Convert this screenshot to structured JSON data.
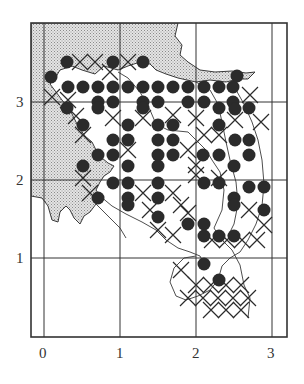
{
  "figure": {
    "type": "distribution-grid-map",
    "x_axis": {
      "ticks": [
        "0",
        "1",
        "2",
        "3"
      ]
    },
    "y_axis": {
      "ticks": [
        "1",
        "2",
        "3"
      ]
    },
    "legend_symbols": {
      "dot": "filled-circle-record",
      "cross": "x-mark-record"
    },
    "colors": {
      "land_shading": "#cfcfcf",
      "ink": "#2b2b2b",
      "background": "#ffffff"
    }
  },
  "dots": [
    [
      51,
      77
    ],
    [
      67,
      62
    ],
    [
      113,
      62
    ],
    [
      143,
      62
    ],
    [
      68,
      87
    ],
    [
      83,
      87
    ],
    [
      98,
      87
    ],
    [
      113,
      87
    ],
    [
      128,
      87
    ],
    [
      143,
      87
    ],
    [
      158,
      87
    ],
    [
      173,
      87
    ],
    [
      188,
      87
    ],
    [
      204,
      87
    ],
    [
      219,
      87
    ],
    [
      233,
      87
    ],
    [
      237,
      76
    ],
    [
      98,
      102
    ],
    [
      113,
      102
    ],
    [
      143,
      102
    ],
    [
      158,
      102
    ],
    [
      188,
      102
    ],
    [
      204,
      102
    ],
    [
      233,
      102
    ],
    [
      67,
      108
    ],
    [
      98,
      108
    ],
    [
      143,
      108
    ],
    [
      219,
      108
    ],
    [
      235,
      109
    ],
    [
      249,
      108
    ],
    [
      83,
      125
    ],
    [
      128,
      125
    ],
    [
      158,
      125
    ],
    [
      173,
      125
    ],
    [
      219,
      125
    ],
    [
      113,
      140
    ],
    [
      128,
      140
    ],
    [
      158,
      140
    ],
    [
      173,
      140
    ],
    [
      235,
      140
    ],
    [
      249,
      140
    ],
    [
      98,
      155
    ],
    [
      113,
      155
    ],
    [
      158,
      155
    ],
    [
      173,
      155
    ],
    [
      203,
      155
    ],
    [
      219,
      155
    ],
    [
      249,
      155
    ],
    [
      83,
      166
    ],
    [
      128,
      166
    ],
    [
      158,
      166
    ],
    [
      234,
      166
    ],
    [
      113,
      183
    ],
    [
      128,
      183
    ],
    [
      158,
      183
    ],
    [
      204,
      183
    ],
    [
      219,
      183
    ],
    [
      98,
      198
    ],
    [
      128,
      198
    ],
    [
      158,
      198
    ],
    [
      234,
      198
    ],
    [
      249,
      187
    ],
    [
      264,
      187
    ],
    [
      128,
      205
    ],
    [
      234,
      205
    ],
    [
      264,
      210
    ],
    [
      158,
      217
    ],
    [
      188,
      224
    ],
    [
      204,
      224
    ],
    [
      234,
      236
    ],
    [
      219,
      236
    ],
    [
      204,
      236
    ],
    [
      204,
      264
    ],
    [
      219,
      280
    ]
  ],
  "crosses": [
    [
      80,
      62
    ],
    [
      95,
      62
    ],
    [
      110,
      72
    ],
    [
      128,
      62
    ],
    [
      52,
      97
    ],
    [
      68,
      100
    ],
    [
      76,
      116
    ],
    [
      83,
      135
    ],
    [
      113,
      118
    ],
    [
      128,
      150
    ],
    [
      83,
      178
    ],
    [
      90,
      193
    ],
    [
      150,
      210
    ],
    [
      143,
      118
    ],
    [
      173,
      115
    ],
    [
      196,
      118
    ],
    [
      204,
      135
    ],
    [
      219,
      135
    ],
    [
      235,
      120
    ],
    [
      250,
      95
    ],
    [
      261,
      122
    ],
    [
      188,
      150
    ],
    [
      196,
      165
    ],
    [
      196,
      175
    ],
    [
      219,
      178
    ],
    [
      249,
      210
    ],
    [
      264,
      225
    ],
    [
      143,
      193
    ],
    [
      173,
      193
    ],
    [
      181,
      205
    ],
    [
      188,
      213
    ],
    [
      212,
      240
    ],
    [
      227,
      240
    ],
    [
      242,
      240
    ],
    [
      257,
      240
    ],
    [
      181,
      270
    ],
    [
      196,
      285
    ],
    [
      211,
      285
    ],
    [
      226,
      285
    ],
    [
      241,
      285
    ],
    [
      188,
      298
    ],
    [
      203,
      298
    ],
    [
      218,
      298
    ],
    [
      233,
      298
    ],
    [
      248,
      298
    ],
    [
      211,
      310
    ],
    [
      226,
      310
    ],
    [
      241,
      310
    ],
    [
      158,
      230
    ],
    [
      173,
      235
    ]
  ]
}
